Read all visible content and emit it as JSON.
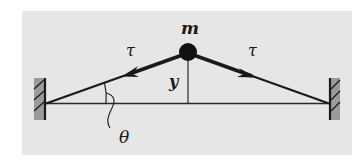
{
  "diagram": {
    "type": "physics-free-body",
    "colors": {
      "background": "#ffffff",
      "panel": "#e6e6e6",
      "ink": "#1a1a1a",
      "wall_fill": "#9a9a9a"
    },
    "labels": {
      "mass": "m",
      "tension_left": "τ",
      "tension_right": "τ",
      "displacement": "y",
      "angle": "θ"
    },
    "elements": {
      "mass": {
        "label": "m",
        "shape": "filled-circle"
      },
      "walls": [
        "left-wall",
        "right-wall"
      ],
      "strings": [
        "left-string",
        "right-string"
      ],
      "tension_arrows": [
        {
          "label": "τ",
          "direction": "toward-left-wall"
        },
        {
          "label": "τ",
          "direction": "toward-right-wall"
        }
      ],
      "baseline": "horizontal-equilibrium-line",
      "displacement_line": {
        "label": "y",
        "orientation": "vertical"
      },
      "angle_marker": {
        "label": "θ",
        "between": "left-string and baseline"
      }
    }
  }
}
